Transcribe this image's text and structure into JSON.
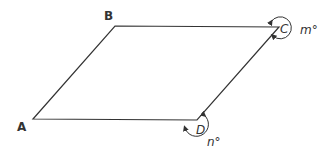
{
  "diagram": {
    "shape": "parallelogram",
    "vertices": [
      {
        "label": "A",
        "x": 33,
        "y": 119
      },
      {
        "label": "B",
        "x": 115,
        "y": 26
      },
      {
        "label": "C",
        "x": 279,
        "y": 27
      },
      {
        "label": "D",
        "x": 197,
        "y": 120
      }
    ],
    "angles": [
      {
        "vertex": "C",
        "label": "m°",
        "type": "reflex"
      },
      {
        "vertex": "D",
        "label": "n°",
        "type": "reflex"
      }
    ],
    "colors": {
      "stroke": "#333333",
      "background": "#ffffff"
    }
  }
}
